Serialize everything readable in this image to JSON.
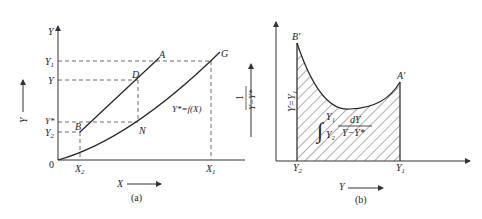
{
  "panel_a": {
    "caption": "(a)",
    "y_axis_label": "Y",
    "x_axis_label": "X",
    "side_label": "Y",
    "origin_label": "0",
    "y_ticks": [
      {
        "label": "Y",
        "sub": "1"
      },
      {
        "label": "Y",
        "sub": ""
      },
      {
        "label": "Y*",
        "sub": ""
      },
      {
        "label": "Y",
        "sub": "2"
      }
    ],
    "x_ticks": [
      {
        "label": "X",
        "sub": "2"
      },
      {
        "label": "X",
        "sub": "1"
      }
    ],
    "points": {
      "A": "A",
      "B": "B",
      "D": "D",
      "N": "N",
      "G": "G"
    },
    "equilibrium_label": "Y*=f(X)"
  },
  "panel_b": {
    "caption": "(b)",
    "x_axis_label": "Y",
    "side_label": "1/(Y−Y*)",
    "side_label_num": "1",
    "side_label_den": "Y−Y*",
    "vertical_label": "Y=Y₁",
    "x_ticks": [
      {
        "label": "Y",
        "sub": "2"
      },
      {
        "label": "Y",
        "sub": "1"
      }
    ],
    "points": {
      "B_prime": "B′",
      "A_prime": "A′"
    },
    "integral": {
      "upper": "Y₁",
      "lower": "Y₂",
      "numerator": "dY",
      "denominator": "Y−Y*"
    }
  }
}
